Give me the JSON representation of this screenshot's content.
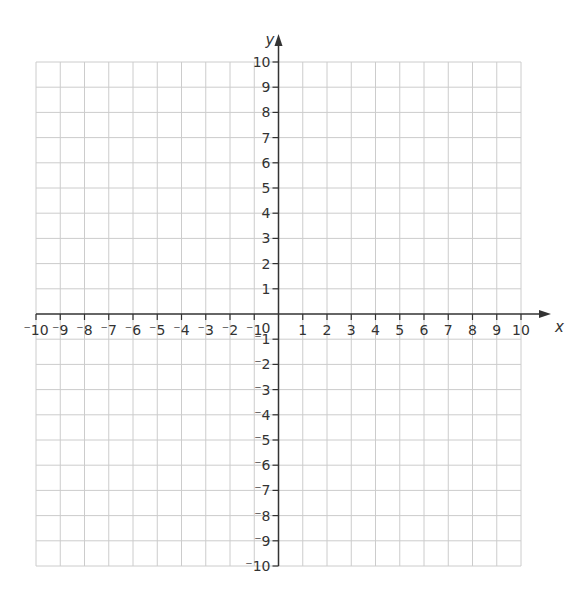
{
  "chart_data": {
    "type": "scatter",
    "title": "",
    "xlabel": "x",
    "ylabel": "y",
    "xlim": [
      -10,
      10
    ],
    "ylim": [
      -10,
      10
    ],
    "grid": true,
    "x_ticks": [
      -10,
      -9,
      -8,
      -7,
      -6,
      -5,
      -4,
      -3,
      -2,
      -1,
      1,
      2,
      3,
      4,
      5,
      6,
      7,
      8,
      9,
      10
    ],
    "y_ticks": [
      -10,
      -9,
      -8,
      -7,
      -6,
      -5,
      -4,
      -3,
      -2,
      -1,
      1,
      2,
      3,
      4,
      5,
      6,
      7,
      8,
      9,
      10
    ],
    "origin_label": "0",
    "series": []
  },
  "colors": {
    "grid": "#cccccc",
    "axis": "#333333"
  }
}
